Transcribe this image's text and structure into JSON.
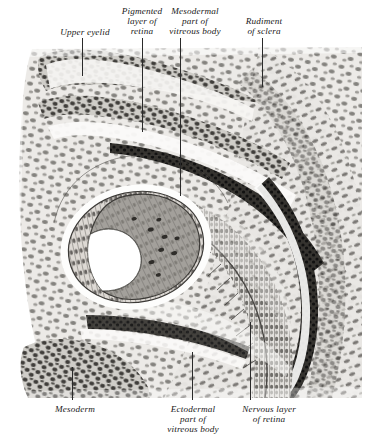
{
  "figure": {
    "top_labels": [
      {
        "id": "upper-eyelid",
        "text": "Upper eyelid",
        "x": 46,
        "y": 27,
        "w": 78,
        "leader_x": 82,
        "leader_y0": 38,
        "leader_y1": 76
      },
      {
        "id": "pigmented-layer",
        "text": "Pigmented\nlayer of\nretina",
        "x": 108,
        "y": 6,
        "w": 68,
        "leader_x": 142,
        "leader_y0": 38,
        "leader_y1": 132
      },
      {
        "id": "mesodermal-vitreous",
        "text": "Mesodermal\npart of\nvitreous body",
        "x": 157,
        "y": 6,
        "w": 76,
        "leader_x": 180,
        "leader_y0": 38,
        "leader_y1": 196
      },
      {
        "id": "rudiment-sclera",
        "text": "Rudiment\nof sclera",
        "x": 231,
        "y": 16,
        "w": 66,
        "leader_x": 262,
        "leader_y0": 38,
        "leader_y1": 87
      }
    ],
    "bottom_labels": [
      {
        "id": "mesoderm",
        "text": "Mesoderm",
        "x": 40,
        "y": 404,
        "w": 70,
        "leader_x": 72,
        "leader_y0": 367,
        "leader_y1": 400
      },
      {
        "id": "ectodermal-vitreous",
        "text": "Ectodermal\npart of\nvitreous body",
        "x": 155,
        "y": 404,
        "w": 76,
        "leader_x": 192,
        "leader_y0": 352,
        "leader_y1": 400
      },
      {
        "id": "nervous-layer",
        "text": "Nervous layer\nof retina",
        "x": 229,
        "y": 404,
        "w": 80,
        "leader_x": 250,
        "leader_y0": 322,
        "leader_y1": 400
      }
    ],
    "colors": {
      "page_background": "#ffffff",
      "tissue_light": "#e9e8e5",
      "tissue_mid": "#c9c7c2",
      "nucleus": "#6f6d69",
      "pigment_dark": "#3a3835",
      "lens_body": "#9b9893",
      "line": "#2a2a2a",
      "label_text": "#1a1a1a"
    },
    "structures": [
      "upper eyelid fold",
      "pigmented layer of retina",
      "nervous layer of retina",
      "mesodermal part of vitreous body",
      "ectodermal part of vitreous body",
      "rudiment of sclera",
      "mesoderm",
      "lens vesicle"
    ]
  }
}
